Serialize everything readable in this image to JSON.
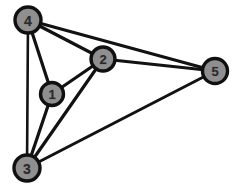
{
  "figure": {
    "name": "undirected-graph",
    "background_color": "#ffffff",
    "width": 245,
    "height": 192
  },
  "style": {
    "edge_color": "#121212",
    "edge_width": 3.2,
    "node_fill": "#8f8f8f",
    "node_stroke": "#101010",
    "node_stroke_width": 3.4,
    "label_color": "#2a2a2a",
    "label_font_size": 13
  },
  "graph": {
    "node_count": 5,
    "edge_count": 9,
    "nodes": [
      {
        "id": "1",
        "label": "1",
        "x": 52,
        "y": 94,
        "r": 11.5,
        "font_size": 13
      },
      {
        "id": "2",
        "label": "2",
        "x": 103,
        "y": 59,
        "r": 12,
        "font_size": 13
      },
      {
        "id": "3",
        "label": "3",
        "x": 27,
        "y": 168,
        "r": 13,
        "font_size": 14
      },
      {
        "id": "4",
        "label": "4",
        "x": 28,
        "y": 20,
        "r": 13,
        "font_size": 14
      },
      {
        "id": "5",
        "label": "5",
        "x": 215,
        "y": 71,
        "r": 12.5,
        "font_size": 13
      }
    ],
    "edges": [
      {
        "source": "4",
        "target": "1",
        "width": 3.2
      },
      {
        "source": "4",
        "target": "2",
        "width": 3.2
      },
      {
        "source": "4",
        "target": "3",
        "width": 2.6
      },
      {
        "source": "4",
        "target": "5",
        "width": 3.2
      },
      {
        "source": "1",
        "target": "2",
        "width": 3.2
      },
      {
        "source": "1",
        "target": "3",
        "width": 3.2
      },
      {
        "source": "2",
        "target": "3",
        "width": 3.2
      },
      {
        "source": "2",
        "target": "5",
        "width": 3.2
      },
      {
        "source": "3",
        "target": "5",
        "width": 3.0
      }
    ]
  }
}
